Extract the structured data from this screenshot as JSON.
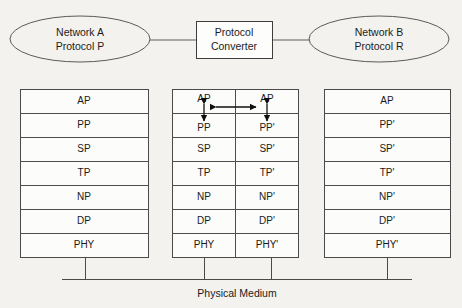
{
  "diagram": {
    "background_color": "#f3f2ef",
    "line_color": "#4a4a4a",
    "text_color": "#1a1a1a"
  },
  "nodes": {
    "network_a": {
      "line1": "Network A",
      "line2": "Protocol P",
      "shape": "ellipse"
    },
    "converter": {
      "line1": "Protocol",
      "line2": "Converter",
      "shape": "rectangle"
    },
    "network_b": {
      "line1": "Network B",
      "line2": "Protocol R",
      "shape": "ellipse"
    }
  },
  "stacks": {
    "left": {
      "name": "Network A protocol stack",
      "layers": [
        "AP",
        "PP",
        "SP",
        "TP",
        "NP",
        "DP",
        "PHY"
      ]
    },
    "middle": {
      "name": "Protocol converter dual stack",
      "left_column": [
        "AP",
        "PP",
        "SP",
        "TP",
        "NP",
        "DP",
        "PHY"
      ],
      "right_column": [
        "AP",
        "PP'",
        "SP'",
        "TP'",
        "NP'",
        "DP'",
        "PHY'"
      ]
    },
    "right": {
      "name": "Network B protocol stack",
      "layers": [
        "AP",
        "PP'",
        "SP'",
        "TP'",
        "NP'",
        "DP'",
        "PHY'"
      ]
    }
  },
  "medium": {
    "label": "Physical Medium"
  },
  "arrows": {
    "horizontal_ap": "bidirectional arrow between AP and AP",
    "vertical_left": "bidirectional arrow between AP and PP",
    "vertical_right": "bidirectional arrow between AP and PP'"
  }
}
